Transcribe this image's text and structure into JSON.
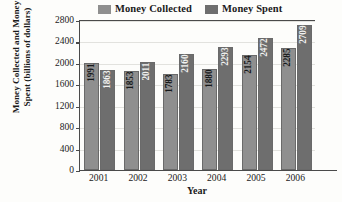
{
  "chart_data": {
    "type": "bar",
    "title": "",
    "xlabel": "Year",
    "ylabel_line1": "Money Collected and Money",
    "ylabel_line2": "Spent (billions of dollars)",
    "categories": [
      "2001",
      "2002",
      "2003",
      "2004",
      "2005",
      "2006"
    ],
    "series": [
      {
        "name": "Money Collected",
        "color": "#8f8f8f",
        "values": [
          1991,
          1853,
          1783,
          1880,
          2154,
          2285
        ]
      },
      {
        "name": "Money Spent",
        "color": "#6e6e6e",
        "values": [
          1863,
          2011,
          2160,
          2293,
          2472,
          2709
        ]
      }
    ],
    "ylim": [
      0,
      2800
    ],
    "yticks": [
      0,
      400,
      800,
      1200,
      1600,
      2000,
      2400,
      2800
    ],
    "ytick_labels": [
      "0",
      "400",
      "800",
      "1200",
      "1600",
      "2000",
      "2400",
      "2800"
    ],
    "grid": true,
    "legend_position": "top"
  },
  "legend": {
    "entries": [
      {
        "label": "Money Collected",
        "swatch": "#8f8f8f"
      },
      {
        "label": "Money Spent",
        "swatch": "#6e6e6e"
      }
    ]
  }
}
